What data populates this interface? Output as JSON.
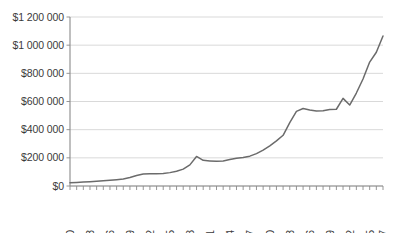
{
  "chart_data": {
    "type": "line",
    "title": "",
    "subtitle": "",
    "xlabel": "",
    "ylabel": "",
    "grid": true,
    "legend": false,
    "legend_position": "none",
    "line_color": "#6b6b6b",
    "grid_color": "#c9c9c9",
    "axis_color": "#8a8a8a",
    "text_color": "#3a3a3a",
    "background_color": "#ffffff",
    "xlim": [
      1970,
      2017
    ],
    "ylim": [
      0,
      1200000
    ],
    "y_tick_step": 200000,
    "y_ticks": [
      0,
      200000,
      400000,
      600000,
      800000,
      1000000,
      1200000
    ],
    "y_tick_labels": [
      "$0",
      "$200 000",
      "$400 000",
      "$600 000",
      "$800 000",
      "$1 000 000",
      "$1 200 000"
    ],
    "x_tick_labels": [
      "1970",
      "1973",
      "1976",
      "1979",
      "1982",
      "1985",
      "1988",
      "1991",
      "1994",
      "1997",
      "2000",
      "2003",
      "2006",
      "2009",
      "2012",
      "2015",
      "2017"
    ],
    "x_tick_values": [
      1970,
      1973,
      1976,
      1979,
      1982,
      1985,
      1988,
      1991,
      1994,
      1997,
      2000,
      2003,
      2006,
      2009,
      2012,
      2015,
      2017
    ],
    "x_minor_ticks_every": 1,
    "x": [
      1970,
      1971,
      1972,
      1973,
      1974,
      1975,
      1976,
      1977,
      1978,
      1979,
      1980,
      1981,
      1982,
      1983,
      1984,
      1985,
      1986,
      1987,
      1988,
      1989,
      1990,
      1991,
      1992,
      1993,
      1994,
      1995,
      1996,
      1997,
      1998,
      1999,
      2000,
      2001,
      2002,
      2003,
      2004,
      2005,
      2006,
      2007,
      2008,
      2009,
      2010,
      2011,
      2012,
      2013,
      2014,
      2015,
      2016,
      2017
    ],
    "values": [
      23000,
      25000,
      28000,
      31000,
      34000,
      37000,
      41000,
      45000,
      50000,
      60000,
      75000,
      85000,
      87000,
      87000,
      88000,
      95000,
      105000,
      120000,
      150000,
      210000,
      182000,
      178000,
      175000,
      178000,
      188000,
      197000,
      203000,
      212000,
      230000,
      255000,
      285000,
      320000,
      360000,
      450000,
      530000,
      550000,
      540000,
      532000,
      534000,
      543000,
      545000,
      622000,
      575000,
      660000,
      760000,
      880000,
      950000,
      1065000
    ],
    "series": [
      {
        "name": "",
        "values": [
          23000,
          25000,
          28000,
          31000,
          34000,
          37000,
          41000,
          45000,
          50000,
          60000,
          75000,
          85000,
          87000,
          87000,
          88000,
          95000,
          105000,
          120000,
          150000,
          210000,
          182000,
          178000,
          175000,
          178000,
          188000,
          197000,
          203000,
          212000,
          230000,
          255000,
          285000,
          320000,
          360000,
          450000,
          530000,
          550000,
          540000,
          532000,
          534000,
          543000,
          545000,
          622000,
          575000,
          660000,
          760000,
          880000,
          950000,
          1065000
        ]
      }
    ],
    "annotations": []
  },
  "plot_geometry": {
    "left": 70,
    "right": 383,
    "top": 17,
    "bottom": 186
  }
}
